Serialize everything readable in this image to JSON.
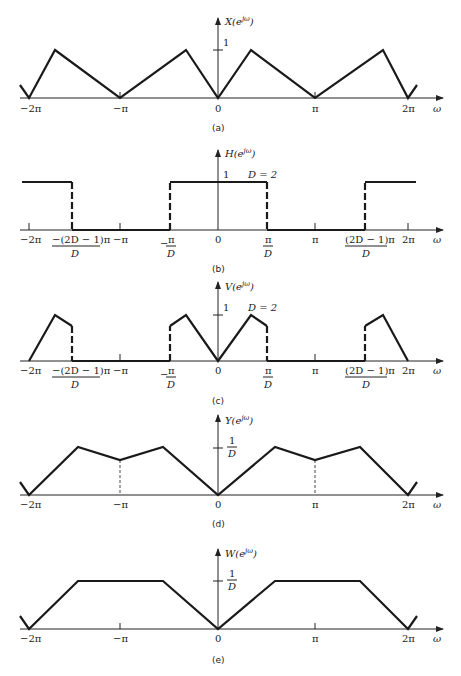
{
  "panels": [
    {
      "id": "a",
      "caption": "(a)",
      "ylabel": "X(e",
      "ylabel_sup": "jω",
      "ylabel_close": ")",
      "unit_label": "1",
      "xlabel": "ω",
      "ticks": [
        "−2π",
        "−π",
        "0",
        "π",
        "2π"
      ]
    },
    {
      "id": "b",
      "caption": "(b)",
      "ylabel": "H(e",
      "ylabel_sup": "jω",
      "ylabel_close": ")",
      "unit_label": "1",
      "param_label": "D = 2",
      "xlabel": "ω",
      "ticks": [
        "−2π",
        "−π",
        "0",
        "π",
        "2π"
      ],
      "frac_ticks": {
        "neg_outer_num": "−(2D − 1)π",
        "neg_outer_den": "D",
        "neg_inner_num": "π",
        "neg_inner_den": "D",
        "neg_inner_sign": "−",
        "pos_inner_num": "π",
        "pos_inner_den": "D",
        "pos_outer_num": "(2D − 1)π",
        "pos_outer_den": "D"
      }
    },
    {
      "id": "c",
      "caption": "(c)",
      "ylabel": "V(e",
      "ylabel_sup": "jω",
      "ylabel_close": ")",
      "unit_label": "1",
      "param_label": "D = 2",
      "xlabel": "ω",
      "ticks": [
        "−2π",
        "−π",
        "0",
        "π",
        "2π"
      ],
      "frac_ticks": {
        "neg_outer_num": "−(2D − 1)π",
        "neg_outer_den": "D",
        "neg_inner_num": "π",
        "neg_inner_den": "D",
        "neg_inner_sign": "−",
        "pos_inner_num": "π",
        "pos_inner_den": "D",
        "pos_outer_num": "(2D − 1)π",
        "pos_outer_den": "D"
      }
    },
    {
      "id": "d",
      "caption": "(d)",
      "ylabel": "Y(e",
      "ylabel_sup": "jω",
      "ylabel_close": ")",
      "unit_num": "1",
      "unit_den": "D",
      "xlabel": "ω",
      "ticks": [
        "−2π",
        "−π",
        "0",
        "π",
        "2π"
      ]
    },
    {
      "id": "e",
      "caption": "(e)",
      "ylabel": "W(e",
      "ylabel_sup": "jω",
      "ylabel_close": ")",
      "unit_num": "1",
      "unit_den": "D",
      "xlabel": "ω",
      "ticks": [
        "−2π",
        "−π",
        "0",
        "π",
        "2π"
      ]
    }
  ]
}
